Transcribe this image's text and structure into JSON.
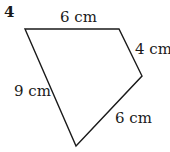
{
  "question_number": "4",
  "shape": {
    "type": "quadrilateral",
    "vertices": [
      [
        25,
        29
      ],
      [
        119,
        29
      ],
      [
        142,
        76
      ],
      [
        76,
        146
      ]
    ],
    "stroke_color": "#1a1a1a"
  },
  "labels": {
    "top": "6 cm",
    "right_upper": "4 cm",
    "left": "9 cm",
    "right_lower": "6 cm"
  }
}
